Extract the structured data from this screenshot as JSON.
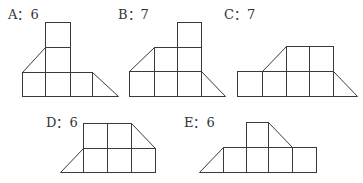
{
  "figures": [
    {
      "id": "A",
      "letter": "A",
      "separator": "：",
      "count": "6",
      "text": "A：6"
    },
    {
      "id": "B",
      "letter": "B",
      "separator": "：",
      "count": "7",
      "text": "B：7"
    },
    {
      "id": "C",
      "letter": "C",
      "separator": "：",
      "count": "7",
      "text": "C：7"
    },
    {
      "id": "D",
      "letter": "D",
      "separator": "：",
      "count": "6",
      "text": "D：6"
    },
    {
      "id": "E",
      "letter": "E",
      "separator": "：",
      "count": "6",
      "text": "E：6"
    }
  ],
  "colors": {
    "line": "#3a3a3a",
    "text": "#333333",
    "background": "#ffffff"
  }
}
